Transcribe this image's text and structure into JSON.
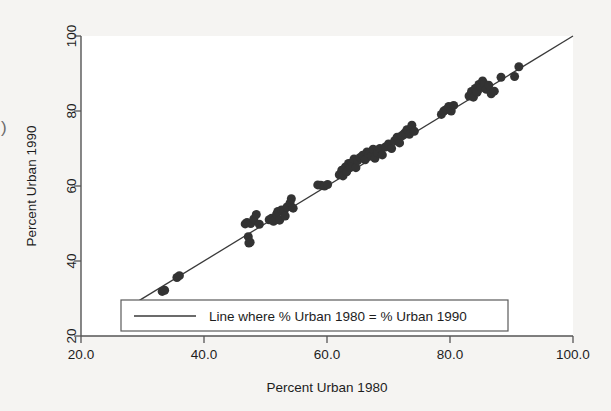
{
  "chart_data": {
    "type": "scatter",
    "title": "",
    "xlabel": "Percent Urban 1980",
    "ylabel": "Percent Urban 1990",
    "xlim": [
      20,
      100
    ],
    "ylim": [
      20,
      100
    ],
    "xticks": [
      20,
      40,
      60,
      80,
      100
    ],
    "xtick_labels": [
      "20.0",
      "40.0",
      "60.0",
      "80.0",
      "100.0"
    ],
    "yticks": [
      20,
      40,
      60,
      80,
      100
    ],
    "ytick_labels": [
      "20",
      "40",
      "60",
      "80",
      "100"
    ],
    "grid": false,
    "marker_color": "#333333",
    "marker_size": 9,
    "line_color": "#3a3a3a",
    "reference_line": {
      "label": "Line where % Urban 1980 = % Urban 1990",
      "x_start": 29.5,
      "y_start": 29.5,
      "x_end": 100.0,
      "y_end": 100.0,
      "slope": 1,
      "intercept": 0
    },
    "legend": {
      "position": "bottom-left-inside",
      "entries": [
        {
          "label": "Line where % Urban 1980 = % Urban 1990",
          "type": "line"
        }
      ]
    },
    "series": [
      {
        "name": "States",
        "points": [
          [
            33.2,
            31.9
          ],
          [
            33.6,
            32.2
          ],
          [
            35.6,
            35.6
          ],
          [
            36.0,
            36.1
          ],
          [
            46.7,
            49.9
          ],
          [
            47.0,
            50.3
          ],
          [
            47.2,
            46.5
          ],
          [
            47.3,
            44.8
          ],
          [
            47.5,
            45.0
          ],
          [
            47.6,
            50.0
          ],
          [
            48.1,
            51.2
          ],
          [
            48.5,
            52.4
          ],
          [
            49.0,
            49.8
          ],
          [
            50.6,
            51.0
          ],
          [
            51.0,
            51.4
          ],
          [
            51.3,
            50.6
          ],
          [
            51.8,
            52.5
          ],
          [
            52.0,
            53.2
          ],
          [
            52.3,
            50.9
          ],
          [
            52.6,
            53.6
          ],
          [
            53.0,
            53.3
          ],
          [
            53.2,
            52.0
          ],
          [
            53.5,
            54.4
          ],
          [
            54.0,
            55.5
          ],
          [
            54.2,
            56.6
          ],
          [
            54.5,
            54.1
          ],
          [
            58.5,
            60.3
          ],
          [
            59.0,
            60.2
          ],
          [
            59.6,
            60.0
          ],
          [
            60.1,
            60.4
          ],
          [
            62.0,
            63.0
          ],
          [
            62.4,
            64.2
          ],
          [
            62.6,
            62.7
          ],
          [
            63.0,
            65.1
          ],
          [
            63.2,
            63.8
          ],
          [
            63.5,
            66.0
          ],
          [
            63.8,
            65.0
          ],
          [
            64.1,
            66.3
          ],
          [
            64.4,
            67.2
          ],
          [
            64.7,
            64.9
          ],
          [
            65.0,
            66.8
          ],
          [
            65.4,
            67.6
          ],
          [
            65.8,
            68.2
          ],
          [
            66.2,
            67.0
          ],
          [
            66.5,
            69.1
          ],
          [
            66.8,
            68.5
          ],
          [
            67.2,
            68.0
          ],
          [
            67.5,
            69.8
          ],
          [
            67.8,
            67.4
          ],
          [
            68.2,
            68.9
          ],
          [
            68.6,
            70.0
          ],
          [
            69.0,
            68.3
          ],
          [
            69.5,
            70.4
          ],
          [
            70.0,
            71.2
          ],
          [
            70.5,
            70.0
          ],
          [
            71.0,
            72.1
          ],
          [
            71.4,
            73.0
          ],
          [
            71.8,
            71.5
          ],
          [
            72.2,
            73.5
          ],
          [
            72.6,
            74.1
          ],
          [
            73.0,
            75.0
          ],
          [
            73.4,
            73.8
          ],
          [
            73.8,
            76.2
          ],
          [
            74.2,
            74.6
          ],
          [
            78.6,
            79.1
          ],
          [
            79.0,
            80.0
          ],
          [
            79.4,
            80.4
          ],
          [
            79.8,
            81.2
          ],
          [
            80.2,
            80.0
          ],
          [
            80.6,
            81.5
          ],
          [
            83.1,
            84.0
          ],
          [
            83.5,
            85.2
          ],
          [
            83.8,
            83.7
          ],
          [
            84.1,
            86.0
          ],
          [
            84.4,
            85.0
          ],
          [
            84.7,
            87.1
          ],
          [
            85.0,
            86.4
          ],
          [
            85.3,
            88.0
          ],
          [
            85.6,
            87.2
          ],
          [
            85.9,
            85.8
          ],
          [
            86.3,
            86.9
          ],
          [
            86.7,
            84.6
          ],
          [
            87.2,
            85.3
          ],
          [
            88.3,
            89.0
          ],
          [
            90.5,
            89.2
          ],
          [
            91.2,
            91.8
          ]
        ]
      }
    ]
  },
  "figure": {
    "edge_artifact": ")",
    "background_color": "#f5f4f2",
    "plot_background_color": "#ffffff",
    "axis_color": "#555555"
  }
}
